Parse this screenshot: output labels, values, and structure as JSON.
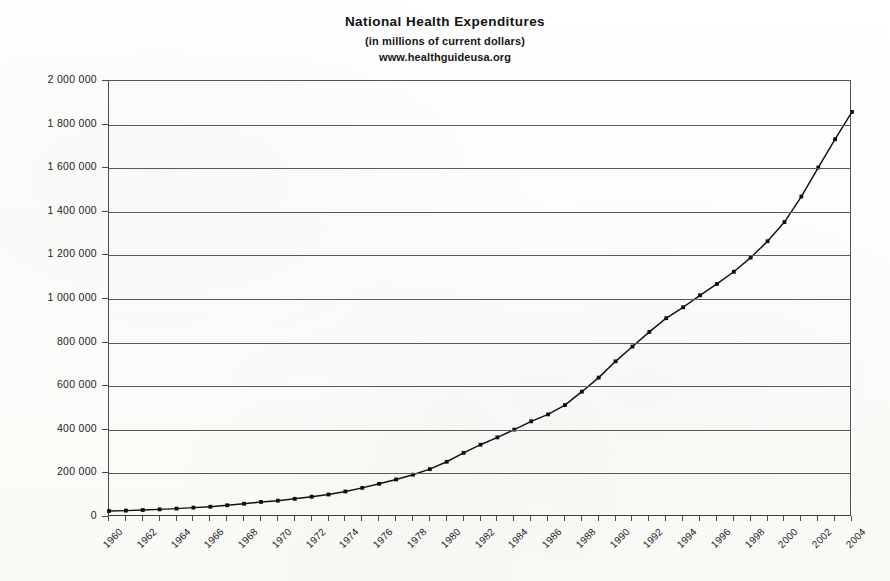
{
  "chart_data": {
    "type": "line",
    "title": "National Health Expenditures",
    "subtitle": "(in millions of current dollars)",
    "source": "www.healthguideusa.org",
    "xlabel": "",
    "ylabel": "",
    "xlim": [
      1960,
      2004
    ],
    "ylim": [
      0,
      2000000
    ],
    "grid": true,
    "legend": "none",
    "y_tick_labels": [
      "2 000 000",
      "1 800 000",
      "1 600 000",
      "1 400 000",
      "1 200 000",
      "1 000 000",
      "800 000",
      "600 000",
      "400 000",
      "200 000",
      "0"
    ],
    "y_tick_values": [
      2000000,
      1800000,
      1600000,
      1400000,
      1200000,
      1000000,
      800000,
      600000,
      400000,
      200000,
      0
    ],
    "x_tick_labels": [
      "1960",
      "1962",
      "1964",
      "1966",
      "1968",
      "1970",
      "1972",
      "1974",
      "1976",
      "1978",
      "1980",
      "1982",
      "1984",
      "1986",
      "1988",
      "1990",
      "1992",
      "1994",
      "1996",
      "1998",
      "2000",
      "2002",
      "2004"
    ],
    "x_minor_tick_step": 1,
    "series_name": "National Health Expenditures",
    "series_color": "#111111",
    "x": [
      1960,
      1961,
      1962,
      1963,
      1964,
      1965,
      1966,
      1967,
      1968,
      1969,
      1970,
      1971,
      1972,
      1973,
      1974,
      1975,
      1976,
      1977,
      1978,
      1979,
      1980,
      1981,
      1982,
      1983,
      1984,
      1985,
      1986,
      1987,
      1988,
      1989,
      1990,
      1991,
      1992,
      1993,
      1994,
      1995,
      1996,
      1997,
      1998,
      1999,
      2000,
      2001,
      2002,
      2003,
      2004
    ],
    "values": [
      27534,
      29363,
      32070,
      35033,
      38452,
      42993,
      47111,
      53829,
      60786,
      69000,
      74894,
      83300,
      93100,
      103200,
      117100,
      133600,
      152200,
      172300,
      194100,
      219500,
      253400,
      294300,
      331600,
      365200,
      400800,
      439000,
      470700,
      513500,
      574800,
      639400,
      714000,
      782000,
      849000,
      912000,
      962000,
      1017000,
      1069000,
      1125000,
      1190000,
      1265000,
      1353000,
      1470000,
      1603000,
      1733000,
      1858000
    ],
    "annotations": []
  }
}
